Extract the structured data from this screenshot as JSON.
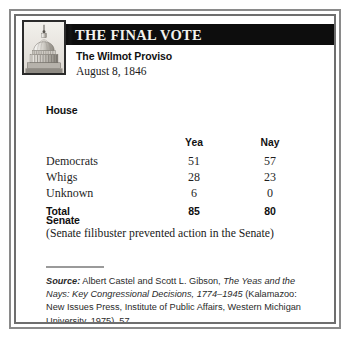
{
  "card": {
    "header_title": "THE FINAL VOTE",
    "bill_name": "The Wilmot Proviso",
    "bill_date": "August 8, 1846",
    "emblem_icon": "capitol-dome-icon"
  },
  "house": {
    "label": "House",
    "columns": [
      "",
      "Yea",
      "Nay"
    ],
    "rows": [
      {
        "party": "Democrats",
        "yea": "51",
        "nay": "57"
      },
      {
        "party": "Whigs",
        "yea": "28",
        "nay": "23"
      },
      {
        "party": "Unknown",
        "yea": "6",
        "nay": "0"
      }
    ],
    "total": {
      "party": "Total",
      "yea": "85",
      "nay": "80"
    }
  },
  "senate": {
    "label": "Senate",
    "note": "(Senate filibuster prevented action in the Senate)"
  },
  "source": {
    "label": "Source:",
    "authors": " Albert Castel and Scott L. Gibson, ",
    "title": "The Yeas and the Nays: Key Congressional Decisions, 1774–1945",
    "publication": " (Kalamazoo: New Issues Press, Institute of Public Affairs, Western Michigan University, 1975), 57."
  },
  "colors": {
    "header_band": "#0d0d0d",
    "header_text": "#f2f2ee",
    "frame_outer": "#8a8a8a",
    "frame_inner": "#6e6e6e",
    "body_text": "#1f1f1f"
  }
}
